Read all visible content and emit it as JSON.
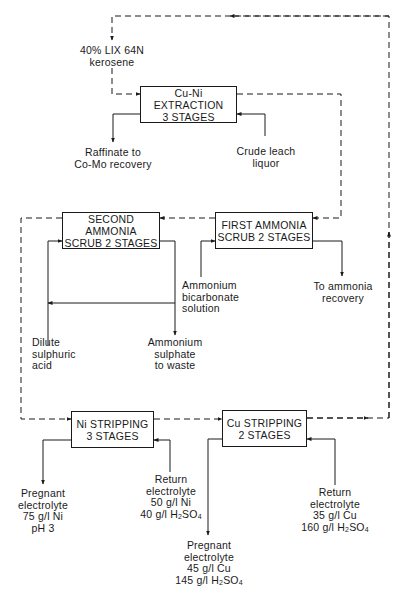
{
  "diagram": {
    "type": "process-flowsheet",
    "colors": {
      "line": "#1a1a1a",
      "background": "#ffffff"
    },
    "boxes": {
      "cu_ni_extraction": {
        "line1": "Cu-Ni EXTRACTION",
        "line2": "3 STAGES"
      },
      "second_ammonia_scrub": {
        "line1": "SECOND AMMONIA",
        "line2": "SCRUB 2 STAGES"
      },
      "first_ammonia_scrub": {
        "line1": "FIRST AMMONIA",
        "line2": "SCRUB 2 STAGES"
      },
      "ni_stripping": {
        "line1": "Ni STRIPPING",
        "line2": "3 STAGES"
      },
      "cu_stripping": {
        "line1": "Cu STRIPPING",
        "line2": "2 STAGES"
      }
    },
    "labels": {
      "organic_feed": {
        "line1": "40% LIX 64N",
        "line2": "kerosene"
      },
      "raffinate": {
        "line1": "Raffinate to",
        "line2": "Co-Mo recovery"
      },
      "crude_leach": {
        "line1": "Crude leach",
        "line2": "liquor"
      },
      "dilute_acid": {
        "line1": "Dilute",
        "line2": "sulphuric",
        "line3": "acid"
      },
      "ammonium_sulphate": {
        "line1": "Ammonium",
        "line2": "sulphate",
        "line3": "to waste"
      },
      "ammonium_bicarbonate": {
        "line1": "Ammonium",
        "line2": "bicarbonate",
        "line3": "solution"
      },
      "ammonia_recovery": {
        "line1": "To ammonia",
        "line2": "recovery"
      },
      "ni_pregnant": {
        "line1": "Pregnant",
        "line2": "electrolyte",
        "line3": "75 g/l Ni",
        "line4": "pH 3"
      },
      "ni_return": {
        "line1": "Return",
        "line2": "electrolyte",
        "line3": "50 g/l Ni",
        "line4a": "40 g/l H",
        "sub1": "2",
        "line4b": "SO",
        "sub2": "4"
      },
      "cu_pregnant": {
        "line1": "Pregnant",
        "line2": "electrolyte",
        "line3": "45 g/l Cu",
        "line4a": "145 g/l H",
        "sub1": "2",
        "line4b": "SO",
        "sub2": "4"
      },
      "cu_return": {
        "line1": "Return",
        "line2": "electrolyte",
        "line3": "35 g/l Cu",
        "line4a": "160 g/l H",
        "sub1": "2",
        "line4b": "SO",
        "sub2": "4"
      }
    },
    "legend": {
      "solid_line": "aqueous stream",
      "dashed_line": "organic stream"
    }
  }
}
